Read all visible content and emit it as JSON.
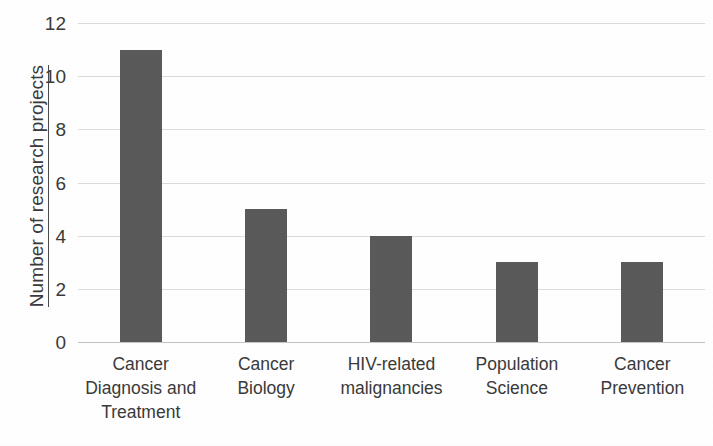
{
  "chart_data": {
    "type": "bar",
    "title": "",
    "xlabel": "",
    "ylabel": "Number of research projects",
    "categories": [
      "Cancer Diagnosis and Treatment",
      "Cancer Biology",
      "HIV-related malignancies",
      "Population Science",
      "Cancer Prevention"
    ],
    "category_lines": [
      [
        "Cancer",
        "Diagnosis and",
        "Treatment"
      ],
      [
        "Cancer",
        "Biology"
      ],
      [
        "HIV-related",
        "malignancies"
      ],
      [
        "Population",
        "Science"
      ],
      [
        "Cancer",
        "Prevention"
      ]
    ],
    "values": [
      11,
      5,
      4,
      3,
      3
    ],
    "ylim": [
      0,
      12
    ],
    "ytick_values": [
      0,
      2,
      4,
      6,
      8,
      10,
      12
    ],
    "ytick_labels": [
      "0",
      "2",
      "4",
      "6",
      "8",
      "10",
      "12"
    ],
    "grid": true,
    "legend": false,
    "bar_color": "#5a5a5a",
    "gridline_color": "#dcdcdc",
    "background_color": "#ffffff"
  }
}
